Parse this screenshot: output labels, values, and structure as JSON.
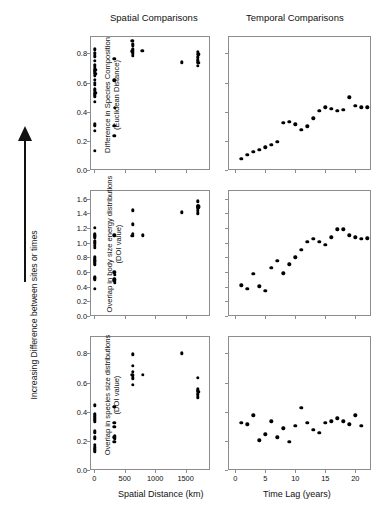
{
  "figure": {
    "column_headings": {
      "spatial": "Spatial Comparisons",
      "temporal": "Temporal Comparisons"
    },
    "global_y_label": "Increasing Difference between sites or times",
    "arrow_icon": "up-arrow-icon",
    "x_axis_titles": {
      "spatial": "Spatial Distance (km)",
      "temporal": "Time Lag (years)"
    },
    "row_y_labels": {
      "top_line1": "Difference in Species Composition",
      "top_line2": "(Euclidean Distance)",
      "mid_line1": "Overlap in body size energy distributions",
      "mid_line2": "(DOI value)",
      "bot_line1": "Overlap in species size distributions",
      "bot_line2": "(DOI value)"
    },
    "colors": {
      "marker": "#000000",
      "frame": "#8d8d8d",
      "text": "#111111"
    }
  },
  "chart_data": [
    {
      "id": "top-left",
      "type": "scatter",
      "title": "Difference in Species Composition vs Spatial Distance",
      "xlabel": "Spatial Distance (km)",
      "ylabel": "Difference in Species Composition (Euclidean Distance)",
      "xlim": [
        -70,
        1900
      ],
      "ylim": [
        0.0,
        0.92
      ],
      "xticks": [
        0,
        500,
        1000,
        1500
      ],
      "yticks": [
        0.0,
        0.2,
        0.4,
        0.6,
        0.8
      ],
      "grid": false,
      "points": [
        [
          5,
          0.83
        ],
        [
          5,
          0.8
        ],
        [
          10,
          0.78
        ],
        [
          8,
          0.75
        ],
        [
          12,
          0.72
        ],
        [
          6,
          0.7
        ],
        [
          14,
          0.69
        ],
        [
          9,
          0.685
        ],
        [
          4,
          0.67
        ],
        [
          16,
          0.66
        ],
        [
          7,
          0.645
        ],
        [
          11,
          0.62
        ],
        [
          5,
          0.6
        ],
        [
          13,
          0.585
        ],
        [
          8,
          0.555
        ],
        [
          6,
          0.545
        ],
        [
          15,
          0.53
        ],
        [
          10,
          0.52
        ],
        [
          7,
          0.505
        ],
        [
          12,
          0.47
        ],
        [
          9,
          0.315
        ],
        [
          6,
          0.305
        ],
        [
          11,
          0.27
        ],
        [
          8,
          0.13
        ],
        [
          330,
          0.765
        ],
        [
          330,
          0.615
        ],
        [
          335,
          0.425
        ],
        [
          330,
          0.305
        ],
        [
          332,
          0.235
        ],
        [
          625,
          0.885
        ],
        [
          630,
          0.865
        ],
        [
          628,
          0.855
        ],
        [
          632,
          0.83
        ],
        [
          626,
          0.815
        ],
        [
          630,
          0.8
        ],
        [
          628,
          0.785
        ],
        [
          790,
          0.82
        ],
        [
          1440,
          0.74
        ],
        [
          1700,
          0.81
        ],
        [
          1705,
          0.795
        ],
        [
          1700,
          0.775
        ],
        [
          1702,
          0.755
        ],
        [
          1698,
          0.745
        ],
        [
          1706,
          0.735
        ],
        [
          1700,
          0.715
        ]
      ]
    },
    {
      "id": "top-right",
      "type": "scatter",
      "title": "Difference in Species Composition vs Time Lag",
      "xlabel": "Time Lag (years)",
      "ylabel": "Difference in Species Composition (Euclidean Distance)",
      "xlim": [
        -1.2,
        22.6
      ],
      "ylim": [
        0.0,
        0.92
      ],
      "xticks": [
        0,
        5,
        10,
        15,
        20
      ],
      "yticks": [
        0.0,
        0.2,
        0.4,
        0.6,
        0.8
      ],
      "grid": false,
      "points": [
        [
          1,
          0.075
        ],
        [
          2,
          0.105
        ],
        [
          3,
          0.125
        ],
        [
          4,
          0.14
        ],
        [
          5,
          0.155
        ],
        [
          6,
          0.175
        ],
        [
          7,
          0.195
        ],
        [
          8,
          0.325
        ],
        [
          9,
          0.33
        ],
        [
          10,
          0.315
        ],
        [
          11,
          0.275
        ],
        [
          12,
          0.3
        ],
        [
          13,
          0.355
        ],
        [
          14,
          0.405
        ],
        [
          15,
          0.43
        ],
        [
          16,
          0.42
        ],
        [
          17,
          0.405
        ],
        [
          18,
          0.415
        ],
        [
          19,
          0.5
        ],
        [
          20,
          0.44
        ],
        [
          21,
          0.43
        ],
        [
          22,
          0.43
        ]
      ]
    },
    {
      "id": "mid-left",
      "type": "scatter",
      "title": "Overlap in body size energy distributions vs Spatial Distance",
      "xlabel": "Spatial Distance (km)",
      "ylabel": "Overlap in body size energy distributions (DOI value)",
      "xlim": [
        -70,
        1900
      ],
      "ylim": [
        0.0,
        1.72
      ],
      "xticks": [
        0,
        500,
        1000,
        1500
      ],
      "yticks": [
        0.0,
        0.2,
        0.4,
        0.6,
        0.8,
        1.0,
        1.2,
        1.4,
        1.6
      ],
      "grid": false,
      "points": [
        [
          6,
          1.2
        ],
        [
          10,
          1.12
        ],
        [
          8,
          1.1
        ],
        [
          13,
          1.095
        ],
        [
          5,
          1.085
        ],
        [
          11,
          1.07
        ],
        [
          7,
          1.02
        ],
        [
          9,
          0.99
        ],
        [
          12,
          0.955
        ],
        [
          6,
          0.93
        ],
        [
          10,
          0.8
        ],
        [
          8,
          0.78
        ],
        [
          11,
          0.76
        ],
        [
          7,
          0.745
        ],
        [
          13,
          0.73
        ],
        [
          9,
          0.715
        ],
        [
          6,
          0.7
        ],
        [
          12,
          0.53
        ],
        [
          8,
          0.52
        ],
        [
          10,
          0.505
        ],
        [
          7,
          0.495
        ],
        [
          9,
          0.375
        ],
        [
          330,
          1.1
        ],
        [
          330,
          0.595
        ],
        [
          334,
          0.565
        ],
        [
          330,
          0.5
        ],
        [
          332,
          0.48
        ],
        [
          336,
          0.455
        ],
        [
          630,
          1.445
        ],
        [
          628,
          1.25
        ],
        [
          632,
          1.12
        ],
        [
          626,
          1.095
        ],
        [
          800,
          1.1
        ],
        [
          1440,
          1.415
        ],
        [
          1700,
          1.565
        ],
        [
          1706,
          1.5
        ],
        [
          1698,
          1.495
        ],
        [
          1710,
          1.485
        ],
        [
          1702,
          1.465
        ],
        [
          1696,
          1.435
        ],
        [
          1704,
          1.4
        ]
      ]
    },
    {
      "id": "mid-right",
      "type": "scatter",
      "title": "Overlap in body size energy distributions vs Time Lag",
      "xlabel": "Time Lag (years)",
      "ylabel": "Overlap in body size energy distributions (DOI value)",
      "xlim": [
        -1.2,
        22.6
      ],
      "ylim": [
        0.0,
        1.72
      ],
      "xticks": [
        0,
        5,
        10,
        15,
        20
      ],
      "yticks": [
        0.0,
        0.2,
        0.4,
        0.6,
        0.8,
        1.0,
        1.2,
        1.4,
        1.6
      ],
      "grid": false,
      "points": [
        [
          1,
          0.42
        ],
        [
          2,
          0.375
        ],
        [
          3,
          0.575
        ],
        [
          4,
          0.405
        ],
        [
          5,
          0.345
        ],
        [
          6,
          0.655
        ],
        [
          7,
          0.755
        ],
        [
          8,
          0.585
        ],
        [
          9,
          0.705
        ],
        [
          10,
          0.8
        ],
        [
          11,
          0.9
        ],
        [
          12,
          1.015
        ],
        [
          13,
          1.05
        ],
        [
          14,
          1.01
        ],
        [
          15,
          0.975
        ],
        [
          16,
          1.075
        ],
        [
          17,
          1.185
        ],
        [
          18,
          1.185
        ],
        [
          19,
          1.1
        ],
        [
          20,
          1.075
        ],
        [
          21,
          1.055
        ],
        [
          22,
          1.06
        ]
      ]
    },
    {
      "id": "bottom-left",
      "type": "scatter",
      "title": "Overlap in species size distributions vs Spatial Distance",
      "xlabel": "Spatial Distance (km)",
      "ylabel": "Overlap in species size distributions (DOI value)",
      "xlim": [
        -70,
        1900
      ],
      "ylim": [
        0.0,
        0.92
      ],
      "xticks": [
        0,
        500,
        1000,
        1500
      ],
      "yticks": [
        0.0,
        0.2,
        0.4,
        0.6,
        0.8
      ],
      "grid": false,
      "points": [
        [
          8,
          0.445
        ],
        [
          6,
          0.385
        ],
        [
          11,
          0.375
        ],
        [
          9,
          0.365
        ],
        [
          13,
          0.355
        ],
        [
          7,
          0.345
        ],
        [
          10,
          0.335
        ],
        [
          6,
          0.265
        ],
        [
          12,
          0.255
        ],
        [
          8,
          0.225
        ],
        [
          9,
          0.215
        ],
        [
          11,
          0.175
        ],
        [
          7,
          0.155
        ],
        [
          10,
          0.145
        ],
        [
          8,
          0.135
        ],
        [
          12,
          0.125
        ],
        [
          330,
          0.435
        ],
        [
          332,
          0.325
        ],
        [
          328,
          0.295
        ],
        [
          334,
          0.235
        ],
        [
          330,
          0.225
        ],
        [
          336,
          0.215
        ],
        [
          330,
          0.195
        ],
        [
          630,
          0.795
        ],
        [
          628,
          0.715
        ],
        [
          632,
          0.675
        ],
        [
          626,
          0.655
        ],
        [
          630,
          0.645
        ],
        [
          634,
          0.63
        ],
        [
          628,
          0.585
        ],
        [
          800,
          0.655
        ],
        [
          1440,
          0.8
        ],
        [
          1700,
          0.635
        ],
        [
          1702,
          0.555
        ],
        [
          1698,
          0.545
        ],
        [
          1706,
          0.535
        ],
        [
          1700,
          0.525
        ],
        [
          1704,
          0.515
        ],
        [
          1696,
          0.5
        ]
      ]
    },
    {
      "id": "bottom-right",
      "type": "scatter",
      "title": "Overlap in species size distributions vs Time Lag",
      "xlabel": "Time Lag (years)",
      "ylabel": "Overlap in species size distributions (DOI value)",
      "xlim": [
        -1.2,
        22.6
      ],
      "ylim": [
        0.0,
        0.92
      ],
      "xticks": [
        0,
        5,
        10,
        15,
        20
      ],
      "yticks": [
        0.0,
        0.2,
        0.4,
        0.6,
        0.8
      ],
      "grid": false,
      "points": [
        [
          1,
          0.325
        ],
        [
          2,
          0.315
        ],
        [
          3,
          0.375
        ],
        [
          4,
          0.205
        ],
        [
          5,
          0.245
        ],
        [
          6,
          0.335
        ],
        [
          7,
          0.225
        ],
        [
          8,
          0.285
        ],
        [
          9,
          0.195
        ],
        [
          10,
          0.305
        ],
        [
          11,
          0.425
        ],
        [
          12,
          0.325
        ],
        [
          13,
          0.275
        ],
        [
          14,
          0.255
        ],
        [
          15,
          0.325
        ],
        [
          16,
          0.335
        ],
        [
          17,
          0.355
        ],
        [
          18,
          0.335
        ],
        [
          19,
          0.315
        ],
        [
          20,
          0.375
        ],
        [
          21,
          0.305
        ]
      ]
    }
  ]
}
